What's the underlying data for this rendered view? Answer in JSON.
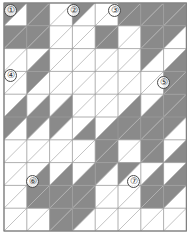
{
  "canvas": {
    "width": 192,
    "height": 242,
    "background": "#ffffff"
  },
  "grid": {
    "columns": 8,
    "rows": 10,
    "cell_width": 22.8,
    "cell_height": 22.8,
    "origin_x": 4,
    "origin_y": 3,
    "line_color": "#9a9a9a",
    "diagonal_color": "#b4b4b4",
    "border_color": "#808080",
    "fill_color": "#8a8a8a",
    "empty_color": "#ffffff",
    "diagonal_direction": "bottom-left-to-top-right"
  },
  "legend": {
    "filled_label": "shaded triangle",
    "empty_label": "plain triangle",
    "cell_label": "half-square-triangle block"
  },
  "chart_data": {
    "type": "heatmap",
    "xlabel": "",
    "ylabel": "",
    "columns": 8,
    "rows": 10,
    "categories": [
      "C1",
      "C2",
      "C3",
      "C4",
      "C5",
      "C6",
      "C7",
      "C8"
    ],
    "row_labels": [
      "R1",
      "R2",
      "R3",
      "R4",
      "R5",
      "R6",
      "R7",
      "R8",
      "R9",
      "R10"
    ],
    "legend_position": "none",
    "grid": true,
    "note": "Each cell value pairs the upper-left triangle fill and lower-right triangle fill. 1 = shaded gray, 0 = unshaded white.",
    "upper_triangles": [
      [
        1,
        1,
        0,
        1,
        0,
        1,
        1,
        1
      ],
      [
        1,
        1,
        0,
        0,
        1,
        0,
        1,
        1
      ],
      [
        0,
        0,
        0,
        0,
        0,
        0,
        1,
        0
      ],
      [
        0,
        1,
        0,
        0,
        0,
        0,
        0,
        1
      ],
      [
        0,
        0,
        0,
        0,
        0,
        0,
        0,
        1
      ],
      [
        1,
        1,
        1,
        0,
        0,
        1,
        1,
        1
      ],
      [
        0,
        0,
        0,
        0,
        1,
        0,
        1,
        0
      ],
      [
        0,
        0,
        0,
        0,
        1,
        1,
        0,
        0
      ],
      [
        0,
        1,
        1,
        1,
        0,
        0,
        1,
        1
      ],
      [
        0,
        0,
        1,
        1,
        0,
        0,
        0,
        0
      ]
    ],
    "lower_triangles": [
      [
        0,
        1,
        0,
        0,
        0,
        1,
        1,
        1
      ],
      [
        1,
        1,
        0,
        0,
        1,
        0,
        1,
        0
      ],
      [
        0,
        1,
        0,
        0,
        0,
        0,
        0,
        1
      ],
      [
        0,
        0,
        0,
        0,
        0,
        0,
        0,
        1
      ],
      [
        1,
        1,
        1,
        0,
        0,
        1,
        1,
        1
      ],
      [
        0,
        0,
        0,
        1,
        1,
        1,
        1,
        0
      ],
      [
        0,
        0,
        0,
        0,
        1,
        0,
        1,
        1
      ],
      [
        0,
        1,
        1,
        1,
        0,
        0,
        1,
        1
      ],
      [
        0,
        1,
        1,
        1,
        0,
        0,
        1,
        0
      ],
      [
        0,
        0,
        1,
        0,
        0,
        0,
        0,
        0
      ]
    ],
    "shaded_count": 62,
    "total_triangles": 160
  },
  "markers": [
    {
      "id": "marker-1",
      "label": "①",
      "number": "1",
      "col": 0,
      "row": 0,
      "x": 4,
      "y": 4
    },
    {
      "id": "marker-2",
      "label": "②",
      "number": "2",
      "col": 3,
      "row": 0,
      "x": 67,
      "y": 4
    },
    {
      "id": "marker-3",
      "label": "③",
      "number": "3",
      "col": 4,
      "row": 0,
      "x": 108,
      "y": 4
    },
    {
      "id": "marker-4",
      "label": "④",
      "number": "4",
      "col": 0,
      "row": 3,
      "x": 4,
      "y": 69
    },
    {
      "id": "marker-5",
      "label": "⑤",
      "number": "5",
      "col": 7,
      "row": 3,
      "x": 157,
      "y": 76
    },
    {
      "id": "marker-6",
      "label": "⑥",
      "number": "6",
      "col": 1,
      "row": 7,
      "x": 26,
      "y": 175
    },
    {
      "id": "marker-7",
      "label": "⑦",
      "number": "7",
      "col": 5,
      "row": 7,
      "x": 127,
      "y": 175
    }
  ]
}
